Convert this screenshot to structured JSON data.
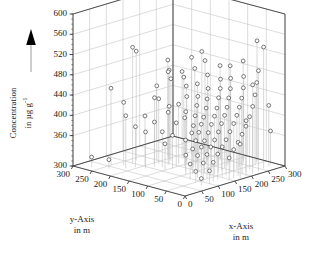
{
  "chart_data": {
    "type": "scatter",
    "projection": "3d",
    "title": "",
    "xlabel": "x-Axis in m",
    "ylabel": "y-Axis in m",
    "zlabel": "Concentration in µg g⁻¹",
    "xlim": [
      0,
      300
    ],
    "ylim": [
      0,
      300
    ],
    "zlim": [
      300,
      600
    ],
    "xticks": [
      0,
      50,
      100,
      150,
      200,
      250,
      300
    ],
    "yticks": [
      0,
      50,
      100,
      150,
      200,
      250,
      300
    ],
    "zticks": [
      300,
      360,
      400,
      440,
      480,
      520,
      560,
      600
    ],
    "grid": true,
    "legend": null,
    "marker": "open-circle",
    "droplines": true,
    "points": [
      {
        "x": 20,
        "y": 268,
        "z": 320
      },
      {
        "x": 58,
        "y": 250,
        "z": 452
      },
      {
        "x": 36,
        "y": 236,
        "z": 318
      },
      {
        "x": 76,
        "y": 232,
        "z": 424
      },
      {
        "x": 62,
        "y": 214,
        "z": 404
      },
      {
        "x": 96,
        "y": 226,
        "z": 530
      },
      {
        "x": 82,
        "y": 206,
        "z": 380
      },
      {
        "x": 104,
        "y": 200,
        "z": 398
      },
      {
        "x": 118,
        "y": 236,
        "z": 516
      },
      {
        "x": 90,
        "y": 186,
        "z": 372
      },
      {
        "x": 112,
        "y": 182,
        "z": 388
      },
      {
        "x": 128,
        "y": 196,
        "z": 430
      },
      {
        "x": 134,
        "y": 190,
        "z": 428
      },
      {
        "x": 146,
        "y": 206,
        "z": 448
      },
      {
        "x": 120,
        "y": 168,
        "z": 370
      },
      {
        "x": 140,
        "y": 170,
        "z": 404
      },
      {
        "x": 152,
        "y": 178,
        "z": 412
      },
      {
        "x": 108,
        "y": 150,
        "z": 352
      },
      {
        "x": 126,
        "y": 146,
        "z": 366
      },
      {
        "x": 144,
        "y": 152,
        "z": 386
      },
      {
        "x": 160,
        "y": 160,
        "z": 418
      },
      {
        "x": 166,
        "y": 186,
        "z": 462
      },
      {
        "x": 172,
        "y": 196,
        "z": 476
      },
      {
        "x": 178,
        "y": 204,
        "z": 470
      },
      {
        "x": 186,
        "y": 212,
        "z": 490
      },
      {
        "x": 156,
        "y": 140,
        "z": 396
      },
      {
        "x": 168,
        "y": 148,
        "z": 404
      },
      {
        "x": 180,
        "y": 156,
        "z": 430
      },
      {
        "x": 192,
        "y": 168,
        "z": 446
      },
      {
        "x": 198,
        "y": 180,
        "z": 460
      },
      {
        "x": 204,
        "y": 190,
        "z": 468
      },
      {
        "x": 136,
        "y": 120,
        "z": 360
      },
      {
        "x": 150,
        "y": 116,
        "z": 372
      },
      {
        "x": 164,
        "y": 124,
        "z": 382
      },
      {
        "x": 176,
        "y": 130,
        "z": 398
      },
      {
        "x": 190,
        "y": 138,
        "z": 414
      },
      {
        "x": 202,
        "y": 146,
        "z": 428
      },
      {
        "x": 214,
        "y": 158,
        "z": 448
      },
      {
        "x": 222,
        "y": 172,
        "z": 474
      },
      {
        "x": 228,
        "y": 186,
        "z": 492
      },
      {
        "x": 110,
        "y": 96,
        "z": 340
      },
      {
        "x": 126,
        "y": 92,
        "z": 350
      },
      {
        "x": 142,
        "y": 98,
        "z": 362
      },
      {
        "x": 158,
        "y": 104,
        "z": 374
      },
      {
        "x": 172,
        "y": 110,
        "z": 386
      },
      {
        "x": 186,
        "y": 116,
        "z": 396
      },
      {
        "x": 200,
        "y": 122,
        "z": 410
      },
      {
        "x": 212,
        "y": 130,
        "z": 424
      },
      {
        "x": 226,
        "y": 140,
        "z": 440
      },
      {
        "x": 238,
        "y": 152,
        "z": 462
      },
      {
        "x": 246,
        "y": 166,
        "z": 486
      },
      {
        "x": 252,
        "y": 180,
        "z": 500
      },
      {
        "x": 96,
        "y": 72,
        "z": 330
      },
      {
        "x": 114,
        "y": 68,
        "z": 344
      },
      {
        "x": 132,
        "y": 74,
        "z": 356
      },
      {
        "x": 148,
        "y": 80,
        "z": 364
      },
      {
        "x": 164,
        "y": 84,
        "z": 376
      },
      {
        "x": 180,
        "y": 90,
        "z": 388
      },
      {
        "x": 196,
        "y": 96,
        "z": 400
      },
      {
        "x": 210,
        "y": 102,
        "z": 412
      },
      {
        "x": 224,
        "y": 110,
        "z": 428
      },
      {
        "x": 238,
        "y": 118,
        "z": 442
      },
      {
        "x": 250,
        "y": 128,
        "z": 456
      },
      {
        "x": 262,
        "y": 140,
        "z": 478
      },
      {
        "x": 86,
        "y": 48,
        "z": 322
      },
      {
        "x": 104,
        "y": 44,
        "z": 336
      },
      {
        "x": 122,
        "y": 50,
        "z": 348
      },
      {
        "x": 140,
        "y": 56,
        "z": 358
      },
      {
        "x": 156,
        "y": 60,
        "z": 368
      },
      {
        "x": 172,
        "y": 64,
        "z": 380
      },
      {
        "x": 188,
        "y": 70,
        "z": 392
      },
      {
        "x": 204,
        "y": 76,
        "z": 404
      },
      {
        "x": 218,
        "y": 82,
        "z": 416
      },
      {
        "x": 232,
        "y": 90,
        "z": 430
      },
      {
        "x": 246,
        "y": 98,
        "z": 444
      },
      {
        "x": 258,
        "y": 108,
        "z": 460
      },
      {
        "x": 270,
        "y": 120,
        "z": 480
      },
      {
        "x": 78,
        "y": 26,
        "z": 314
      },
      {
        "x": 98,
        "y": 22,
        "z": 326
      },
      {
        "x": 116,
        "y": 28,
        "z": 338
      },
      {
        "x": 134,
        "y": 32,
        "z": 350
      },
      {
        "x": 152,
        "y": 36,
        "z": 360
      },
      {
        "x": 168,
        "y": 40,
        "z": 370
      },
      {
        "x": 184,
        "y": 44,
        "z": 382
      },
      {
        "x": 200,
        "y": 48,
        "z": 394
      },
      {
        "x": 216,
        "y": 54,
        "z": 406
      },
      {
        "x": 230,
        "y": 60,
        "z": 418
      },
      {
        "x": 244,
        "y": 66,
        "z": 432
      },
      {
        "x": 258,
        "y": 74,
        "z": 448
      },
      {
        "x": 270,
        "y": 84,
        "z": 466
      },
      {
        "x": 282,
        "y": 96,
        "z": 492
      },
      {
        "x": 146,
        "y": 12,
        "z": 344
      },
      {
        "x": 164,
        "y": 16,
        "z": 356
      },
      {
        "x": 182,
        "y": 20,
        "z": 366
      },
      {
        "x": 198,
        "y": 24,
        "z": 378
      },
      {
        "x": 214,
        "y": 28,
        "z": 390
      },
      {
        "x": 232,
        "y": 34,
        "z": 404
      },
      {
        "x": 248,
        "y": 40,
        "z": 420
      },
      {
        "x": 264,
        "y": 48,
        "z": 438
      },
      {
        "x": 278,
        "y": 56,
        "z": 458
      },
      {
        "x": 290,
        "y": 66,
        "z": 536
      },
      {
        "x": 236,
        "y": 14,
        "z": 498
      },
      {
        "x": 256,
        "y": 18,
        "z": 540
      },
      {
        "x": 212,
        "y": 8,
        "z": 476
      },
      {
        "x": 190,
        "y": 6,
        "z": 410
      },
      {
        "x": 170,
        "y": 4,
        "z": 368
      },
      {
        "x": 288,
        "y": 28,
        "z": 366
      },
      {
        "x": 276,
        "y": 22,
        "z": 420
      }
    ]
  },
  "axes": {
    "z": {
      "title_line1": "Concentration",
      "title_line2": "in µg g",
      "title_sup": "-1",
      "ticks": [
        "600",
        "560",
        "520",
        "480",
        "440",
        "400",
        "360",
        "300"
      ]
    },
    "y": {
      "title_line1": "y-Axis",
      "title_line2": "in m",
      "ticks": [
        "300",
        "250",
        "200",
        "150",
        "100",
        "50",
        "0"
      ]
    },
    "x": {
      "title_line1": "x-Axis",
      "title_line2": "in m",
      "ticks": [
        "0",
        "50",
        "100",
        "150",
        "200",
        "250",
        "300"
      ]
    }
  },
  "style": {
    "marker_stroke": "#444444",
    "dropline_color": "#c8c8c8",
    "grid_color": "#b4b4b4",
    "axis_color": "#333333",
    "arrow_color": "#000000",
    "background": "#ffffff"
  }
}
